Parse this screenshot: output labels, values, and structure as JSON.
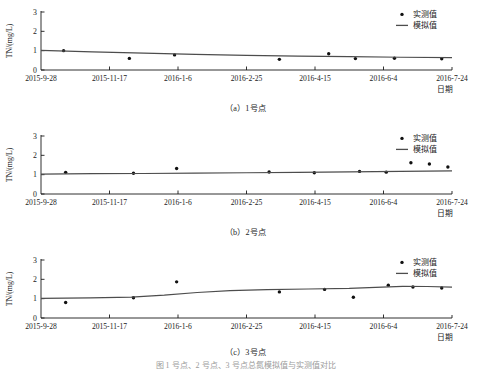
{
  "figure": {
    "bottom_caption": "图   1 号点、2 号点、3 号点总氮模拟值与实测值对比",
    "panels": [
      {
        "caption": "（a）1号点",
        "chart_data": {
          "type": "scatter",
          "title": "",
          "xlabel": "日期",
          "ylabel": "TN/(mg/L)",
          "ylim": [
            0,
            3
          ],
          "yticks": [
            0,
            1,
            2,
            3
          ],
          "xlim": [
            "2015-9-28",
            "2016-7-24"
          ],
          "xticks": [
            "2015-9-28",
            "2015-11-17",
            "2016-1-6",
            "2016-2-25",
            "2016-4-15",
            "2016-6-4",
            "2016-7-24"
          ],
          "grid": false,
          "legend_position": "top-right",
          "series": [
            {
              "name": "实测值",
              "type": "scatter",
              "x": [
                0.055,
                0.215,
                0.325,
                0.58,
                0.7,
                0.765,
                0.86,
                0.975
              ],
              "values": [
                1.0,
                0.6,
                0.78,
                0.55,
                0.84,
                0.59,
                0.61,
                0.58
              ]
            },
            {
              "name": "模拟值",
              "type": "line",
              "x": [
                0.0,
                0.125,
                0.25,
                0.375,
                0.5,
                0.625,
                0.75,
                0.875,
                1.0
              ],
              "values": [
                1.02,
                0.94,
                0.87,
                0.81,
                0.76,
                0.72,
                0.69,
                0.66,
                0.64
              ]
            }
          ]
        }
      },
      {
        "caption": "（b）2号点",
        "chart_data": {
          "type": "scatter",
          "title": "",
          "xlabel": "日期",
          "ylabel": "TN/(mg/L)",
          "ylim": [
            0,
            3
          ],
          "yticks": [
            0,
            1,
            2,
            3
          ],
          "xlim": [
            "2015-9-28",
            "2016-7-24"
          ],
          "xticks": [
            "2015-9-28",
            "2015-11-17",
            "2016-1-6",
            "2016-2-25",
            "2016-4-15",
            "2016-6-4",
            "2016-7-24"
          ],
          "grid": false,
          "legend_position": "top-right",
          "series": [
            {
              "name": "实测值",
              "type": "scatter",
              "x": [
                0.06,
                0.225,
                0.33,
                0.555,
                0.665,
                0.775,
                0.84,
                0.9,
                0.945,
                0.99
              ],
              "values": [
                1.12,
                1.07,
                1.32,
                1.14,
                1.1,
                1.17,
                1.13,
                1.62,
                1.55,
                1.4
              ]
            },
            {
              "name": "模拟值",
              "type": "line",
              "x": [
                0.0,
                0.125,
                0.25,
                0.375,
                0.5,
                0.625,
                0.75,
                0.875,
                1.0
              ],
              "values": [
                1.03,
                1.05,
                1.06,
                1.08,
                1.1,
                1.12,
                1.14,
                1.17,
                1.2
              ]
            }
          ]
        }
      },
      {
        "caption": "（c）3号点",
        "chart_data": {
          "type": "scatter",
          "title": "",
          "xlabel": "日期",
          "ylabel": "TN/(mg/L)",
          "ylim": [
            0,
            3
          ],
          "yticks": [
            0,
            1,
            2,
            3
          ],
          "xlim": [
            "2015-9-28",
            "2016-7-24"
          ],
          "xticks": [
            "2015-9-28",
            "2015-11-17",
            "2016-1-6",
            "2016-2-25",
            "2016-4-15",
            "2016-6-4",
            "2016-7-24"
          ],
          "grid": false,
          "legend_position": "top-right",
          "series": [
            {
              "name": "实测值",
              "type": "scatter",
              "x": [
                0.06,
                0.225,
                0.33,
                0.58,
                0.69,
                0.76,
                0.845,
                0.905,
                0.975
              ],
              "values": [
                0.8,
                1.05,
                1.87,
                1.35,
                1.48,
                1.07,
                1.7,
                1.6,
                1.55
              ]
            },
            {
              "name": "模拟值",
              "type": "line",
              "x": [
                0.0,
                0.12,
                0.22,
                0.3,
                0.38,
                0.46,
                0.55,
                0.65,
                0.75,
                0.83,
                0.88,
                0.94,
                1.0
              ],
              "values": [
                1.02,
                1.04,
                1.08,
                1.18,
                1.32,
                1.42,
                1.47,
                1.5,
                1.53,
                1.6,
                1.64,
                1.63,
                1.6
              ]
            }
          ]
        }
      }
    ]
  },
  "style": {
    "axis_color": "#1a1a1a",
    "line_color": "#4d4d4d",
    "marker_color": "#111111",
    "tick_color": "#1a1a1a"
  }
}
